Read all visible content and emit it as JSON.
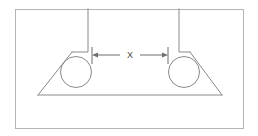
{
  "figure": {
    "background_color": "#ffffff",
    "line_color": "#8a8a8a",
    "border_color": "#b4b4b4",
    "dimension_color": "#6f6f6f",
    "label_color": "#4a4a4a",
    "canvas": {
      "width": 258,
      "height": 136
    }
  },
  "border": {
    "name": "outer-frame",
    "x": 15,
    "y": 9,
    "width": 229,
    "height": 120,
    "stroke_width": 1
  },
  "blocks": [
    {
      "name": "left-block",
      "left": 15,
      "top": 9,
      "right": 88,
      "bottom": 52
    },
    {
      "name": "right-block",
      "left": 179,
      "top": 9,
      "right": 244,
      "bottom": 52
    }
  ],
  "wedge": {
    "name": "triangular-wedge",
    "base_left_x": 38,
    "base_right_x": 222,
    "base_y": 95,
    "left_apex_x": 72,
    "left_apex_y": 52,
    "right_apex_x": 190,
    "right_apex_y": 52
  },
  "rollers": [
    {
      "name": "left-roller",
      "center_x": 76,
      "center_y": 72,
      "radius": 15.5
    },
    {
      "name": "right-roller",
      "center_x": 184,
      "center_y": 72,
      "radius": 15.5
    }
  ],
  "dimension": {
    "name": "gap-dimension-x",
    "label": "X",
    "label_x": 130,
    "label_y": 55,
    "line_y": 55,
    "left_tick_x": 92,
    "right_tick_x": 168,
    "tick_top_y": 47,
    "tick_bottom_y": 64,
    "arrow_size": 4,
    "left_segment_end": 118,
    "right_segment_start": 142
  }
}
